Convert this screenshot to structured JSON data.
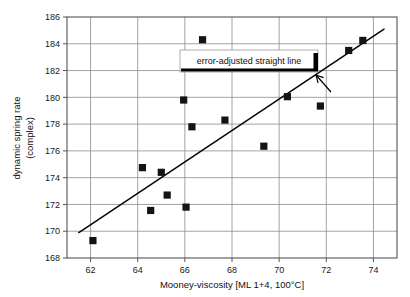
{
  "chart_data": {
    "type": "scatter",
    "title": "",
    "xlabel": "Mooney-viscosity [ML 1+4, 100°C]",
    "ylabel_line1": "dynamic spring rate",
    "ylabel_line2": "(complex)",
    "xlim": [
      61,
      75
    ],
    "ylim": [
      168,
      186
    ],
    "xticks": [
      62,
      64,
      66,
      68,
      70,
      72,
      74
    ],
    "yticks": [
      168,
      170,
      172,
      174,
      176,
      178,
      180,
      182,
      184,
      186
    ],
    "xtick_labels": [
      "62",
      "64",
      "66",
      "68",
      "70",
      "72",
      "74"
    ],
    "ytick_labels": [
      "168",
      "170",
      "172",
      "174",
      "176",
      "178",
      "180",
      "182",
      "184",
      "186"
    ],
    "grid": true,
    "legend_position": "inside-top-center",
    "series": [
      {
        "name": "measurements",
        "marker": "square",
        "color": "#141414",
        "points": [
          {
            "x": 62.1,
            "y": 169.3
          },
          {
            "x": 64.2,
            "y": 174.75
          },
          {
            "x": 64.55,
            "y": 171.55
          },
          {
            "x": 65.0,
            "y": 174.4
          },
          {
            "x": 65.25,
            "y": 172.7
          },
          {
            "x": 65.95,
            "y": 179.8
          },
          {
            "x": 66.05,
            "y": 171.8
          },
          {
            "x": 66.3,
            "y": 177.8
          },
          {
            "x": 66.75,
            "y": 184.3
          },
          {
            "x": 67.7,
            "y": 178.3
          },
          {
            "x": 69.35,
            "y": 176.35
          },
          {
            "x": 70.35,
            "y": 180.05
          },
          {
            "x": 71.75,
            "y": 179.35
          },
          {
            "x": 72.95,
            "y": 183.5
          },
          {
            "x": 73.55,
            "y": 184.25
          }
        ]
      }
    ],
    "fit_line": {
      "name": "error-adjusted straight line",
      "x_start": 61.5,
      "y_start": 169.9,
      "x_end": 74.45,
      "y_end": 185.1,
      "color": "#000000"
    },
    "annotations": [
      {
        "kind": "callout",
        "text": "error-adjusted straight line",
        "points_to_x": 71.9,
        "points_to_y": 181.9
      }
    ]
  },
  "legend": {
    "label": "error-adjusted straight line"
  },
  "axes": {
    "x_title": "Mooney-viscosity [ML 1+4, 100°C]",
    "y_title_line1": "dynamic spring rate",
    "y_title_line2": "(complex)"
  }
}
